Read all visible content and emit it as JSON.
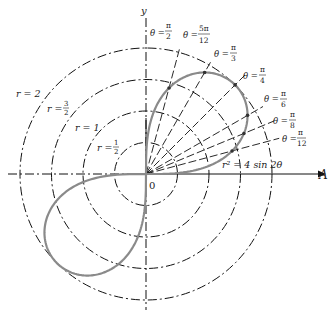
{
  "diagram": {
    "equation": "r² = 4 sin 2θ",
    "origin_label": "0",
    "axes": {
      "x_label": "A",
      "y_label": "y"
    },
    "circles": [
      {
        "r_value": 0.5,
        "label_lhs": "r =",
        "label_num": "1",
        "label_den": "2"
      },
      {
        "r_value": 1,
        "label": "r = 1"
      },
      {
        "r_value": 1.5,
        "label_lhs": "r =",
        "label_num": "3",
        "label_den": "2"
      },
      {
        "r_value": 2,
        "label": "r = 2"
      }
    ],
    "rays": [
      {
        "theta": "π/12",
        "lhs": "θ =",
        "num": "π",
        "den": "12"
      },
      {
        "theta": "π/8",
        "lhs": "θ =",
        "num": "π",
        "den": "8"
      },
      {
        "theta": "π/6",
        "lhs": "θ =",
        "num": "π",
        "den": "6"
      },
      {
        "theta": "π/4",
        "lhs": "θ =",
        "num": "π",
        "den": "4"
      },
      {
        "theta": "π/3",
        "lhs": "θ =",
        "num": "π",
        "den": "3"
      },
      {
        "theta": "5π/12",
        "lhs": "θ =",
        "num": "5π",
        "den": "12"
      },
      {
        "theta": "π/2",
        "lhs": "θ =",
        "num": "π",
        "den": "2"
      }
    ],
    "colors": {
      "curve": "#8a8a8a",
      "lines": "#111111"
    }
  }
}
